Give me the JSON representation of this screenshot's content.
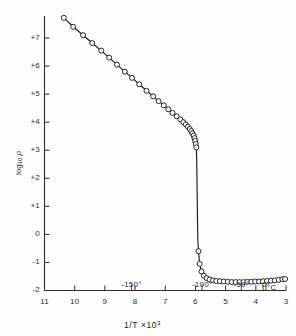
{
  "figure": {
    "background": "#fdfdfd",
    "ink_color": "#1a1a1a",
    "marker_fill": "#ffffff"
  },
  "axis": {
    "y_label_text": "log",
    "y_label_sub": "10",
    "y_label_var": "ρ",
    "x_label_text": "1/T",
    "x_label_mult": "×10",
    "x_label_exp": "3",
    "temperature_unit": "t  °C"
  },
  "chart_data": {
    "type": "line",
    "title": "",
    "subtitle": "",
    "xlabel": "1/T ×10³",
    "ylabel": "log₁₀ ρ",
    "secondary_xlabel": "t °C",
    "grid": false,
    "legend": "none",
    "xlim": [
      11,
      3
    ],
    "ylim": [
      -2,
      8
    ],
    "x_inverted": true,
    "xticks": [
      11,
      10,
      9,
      8,
      7,
      6,
      5,
      4,
      3
    ],
    "xtick_labels": [
      "11",
      "10",
      "9",
      "8",
      "7",
      "6",
      "5",
      "4",
      "3"
    ],
    "yticks": [
      -2,
      -1,
      0,
      1,
      2,
      3,
      4,
      5,
      6,
      7
    ],
    "ytick_labels": [
      "-2",
      "-1",
      "0",
      "+1",
      "+2",
      "+3",
      "+4",
      "+5",
      "+6",
      "+7"
    ],
    "secondary_xticks": [
      8.12,
      5.78,
      4.48,
      3.66
    ],
    "secondary_xtick_labels": [
      "-150°",
      "-100°",
      "-50°",
      "0°"
    ],
    "marker": "open-circle",
    "series": [
      {
        "name": "resistivity",
        "x": [
          10.36,
          10.05,
          9.72,
          9.42,
          9.12,
          8.86,
          8.6,
          8.34,
          8.1,
          7.86,
          7.62,
          7.4,
          7.22,
          7.05,
          6.9,
          6.76,
          6.62,
          6.5,
          6.4,
          6.32,
          6.25,
          6.19,
          6.14,
          6.1,
          6.06,
          6.03,
          6.01,
          5.99,
          5.97,
          5.96,
          5.95,
          5.94,
          5.93,
          5.92,
          5.9,
          5.86,
          5.8,
          5.72,
          5.63,
          5.53,
          5.42,
          5.31,
          5.19,
          5.06,
          4.93,
          4.8,
          4.67,
          4.54,
          4.41,
          4.28,
          4.15,
          4.02,
          3.89,
          3.76,
          3.63,
          3.5,
          3.37,
          3.24,
          3.12,
          3.03
        ],
        "y": [
          7.72,
          7.4,
          7.1,
          6.82,
          6.55,
          6.3,
          6.05,
          5.8,
          5.58,
          5.35,
          5.12,
          4.92,
          4.75,
          4.6,
          4.46,
          4.33,
          4.21,
          4.1,
          4.0,
          3.92,
          3.84,
          3.76,
          3.68,
          3.6,
          3.52,
          3.43,
          3.33,
          3.22,
          3.1,
          2.7,
          2.0,
          1.2,
          0.4,
          -0.2,
          -0.6,
          -1.05,
          -1.32,
          -1.47,
          -1.56,
          -1.61,
          -1.64,
          -1.66,
          -1.67,
          -1.68,
          -1.69,
          -1.7,
          -1.7,
          -1.7,
          -1.7,
          -1.69,
          -1.69,
          -1.68,
          -1.68,
          -1.67,
          -1.66,
          -1.65,
          -1.64,
          -1.62,
          -1.6,
          -1.59
        ]
      }
    ]
  }
}
